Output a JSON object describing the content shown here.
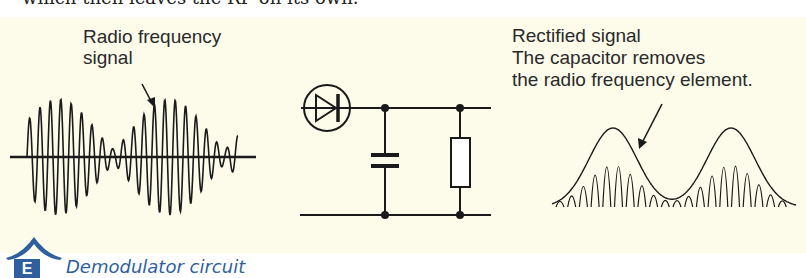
{
  "header": {
    "partial_text": "which then leaves the RF on its own."
  },
  "labels": {
    "rf_signal_line1": "Radio frequency",
    "rf_signal_line2": "signal",
    "rectified_line1": "Rectified signal",
    "rectified_line2": "The capacitor removes",
    "rectified_line3": "the radio frequency element."
  },
  "circuit": {
    "components": [
      "diode",
      "capacitor",
      "resistor"
    ]
  },
  "caption": {
    "badge": "E",
    "title": "Demodulator circuit"
  },
  "colors": {
    "panel_bg": "#fdfcea",
    "accent": "#2f5f9f",
    "line": "#1a1a1a"
  }
}
